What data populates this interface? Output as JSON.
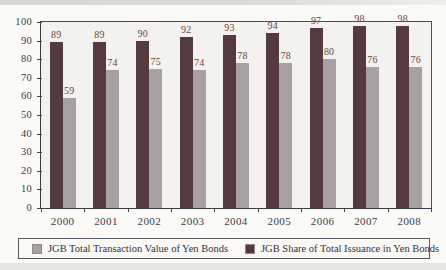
{
  "chart_data": {
    "type": "bar",
    "title": "",
    "categories": [
      "2000",
      "2001",
      "2002",
      "2003",
      "2004",
      "2005",
      "2006",
      "2007",
      "2008"
    ],
    "series": [
      {
        "name": "JGB Share of Total Issuance in Yen Bonds",
        "values": [
          89,
          89,
          90,
          92,
          93,
          94,
          97,
          98,
          98
        ],
        "color": "#553b40",
        "label_color": "#6f443c"
      },
      {
        "name": "JGB Total Transaction Value of Yen Bonds",
        "values": [
          59,
          74,
          75,
          74,
          78,
          78,
          80,
          76,
          76
        ],
        "color": "#a8a1a3",
        "label_color": "#6f443c"
      }
    ],
    "ylim": [
      0,
      100
    ],
    "yticks": [
      0,
      10,
      20,
      30,
      40,
      50,
      60,
      70,
      80,
      90,
      100
    ],
    "grid": false,
    "bar_value_labels": true,
    "legend_position": "bottom",
    "legend": [
      {
        "label": "JGB Total Transaction Value of Yen Bonds",
        "color": "#a8a1a3"
      },
      {
        "label": "JGB Share of Total Issuance in Yen Bonds",
        "color": "#553b40"
      }
    ]
  },
  "colors": {
    "plot_background": "#f3f2ef",
    "page_background": "#fbfaf7",
    "axis_line": "#44464a",
    "axis_text": "#383e48",
    "legend_text": "#2e3440"
  }
}
